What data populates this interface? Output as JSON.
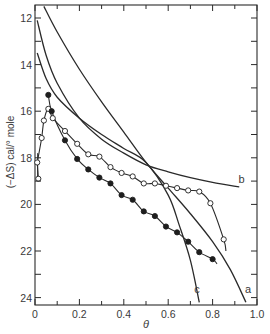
{
  "chart_data": {
    "type": "line",
    "title": "",
    "xlabel": "θ",
    "ylabel": "(−ΔS) cal/° mole",
    "xlim": [
      0,
      1.0
    ],
    "ylim": [
      24.2,
      11.4
    ],
    "y_inverted": true,
    "grid": false,
    "x_ticks": [
      0,
      0.2,
      0.4,
      0.6,
      0.8,
      1.0
    ],
    "x_tick_labels": [
      "0",
      "0.2",
      "0.4",
      "0.6",
      "0.8",
      "1.0"
    ],
    "y_ticks": [
      12,
      14,
      16,
      18,
      20,
      22,
      24
    ],
    "y_tick_labels": [
      "12",
      "14",
      "16",
      "18",
      "20",
      "22",
      "24"
    ],
    "series": [
      {
        "name": "a",
        "kind": "curve",
        "points": [
          [
            0.04,
            11.5
          ],
          [
            0.1,
            12.6
          ],
          [
            0.2,
            14.2
          ],
          [
            0.3,
            15.6
          ],
          [
            0.4,
            16.9
          ],
          [
            0.5,
            18.2
          ],
          [
            0.6,
            19.3
          ],
          [
            0.7,
            20.4
          ],
          [
            0.8,
            21.6
          ],
          [
            0.88,
            22.8
          ],
          [
            0.95,
            24.2
          ]
        ]
      },
      {
        "name": "b",
        "kind": "curve",
        "points": [
          [
            0.01,
            12.1
          ],
          [
            0.05,
            13.6
          ],
          [
            0.1,
            14.8
          ],
          [
            0.2,
            16.3
          ],
          [
            0.3,
            17.2
          ],
          [
            0.4,
            17.8
          ],
          [
            0.5,
            18.3
          ],
          [
            0.6,
            18.6
          ],
          [
            0.7,
            18.85
          ],
          [
            0.8,
            19.05
          ],
          [
            0.92,
            19.25
          ]
        ]
      },
      {
        "name": "c",
        "kind": "curve",
        "points": [
          [
            0.01,
            13.5
          ],
          [
            0.05,
            14.6
          ],
          [
            0.1,
            15.4
          ],
          [
            0.2,
            16.3
          ],
          [
            0.3,
            17.0
          ],
          [
            0.4,
            17.6
          ],
          [
            0.5,
            18.2
          ],
          [
            0.6,
            19.6
          ],
          [
            0.65,
            20.9
          ],
          [
            0.7,
            22.4
          ],
          [
            0.74,
            24.2
          ]
        ]
      },
      {
        "name": "open circles",
        "kind": "markers",
        "marker": "open-circle",
        "points": [
          [
            0.015,
            18.9
          ],
          [
            0.01,
            18.2
          ],
          [
            0.03,
            17.15
          ],
          [
            0.04,
            16.4
          ],
          [
            0.06,
            15.9
          ],
          [
            0.08,
            16.3
          ],
          [
            0.135,
            16.85
          ],
          [
            0.19,
            17.4
          ],
          [
            0.24,
            17.85
          ],
          [
            0.29,
            17.95
          ],
          [
            0.34,
            18.4
          ],
          [
            0.39,
            18.65
          ],
          [
            0.44,
            18.8
          ],
          [
            0.49,
            19.1
          ],
          [
            0.54,
            19.1
          ],
          [
            0.59,
            19.2
          ],
          [
            0.64,
            19.3
          ],
          [
            0.69,
            19.4
          ],
          [
            0.74,
            19.45
          ],
          [
            0.79,
            19.95
          ],
          [
            0.85,
            21.5
          ]
        ]
      },
      {
        "name": "filled circles",
        "kind": "markers",
        "marker": "filled-circle",
        "points": [
          [
            0.06,
            15.3
          ],
          [
            0.075,
            16.0
          ],
          [
            0.135,
            17.25
          ],
          [
            0.19,
            18.05
          ],
          [
            0.24,
            18.5
          ],
          [
            0.29,
            18.85
          ],
          [
            0.34,
            19.1
          ],
          [
            0.39,
            19.6
          ],
          [
            0.44,
            19.8
          ],
          [
            0.49,
            20.3
          ],
          [
            0.54,
            20.5
          ],
          [
            0.59,
            20.95
          ],
          [
            0.64,
            21.2
          ],
          [
            0.69,
            21.6
          ],
          [
            0.74,
            22.05
          ],
          [
            0.8,
            22.35
          ]
        ]
      }
    ],
    "annotations": [
      {
        "text": "a",
        "x": 0.96,
        "y": 23.8
      },
      {
        "text": "b",
        "x": 0.93,
        "y": 19.1
      },
      {
        "text": "c",
        "x": 0.73,
        "y": 23.8
      }
    ]
  }
}
